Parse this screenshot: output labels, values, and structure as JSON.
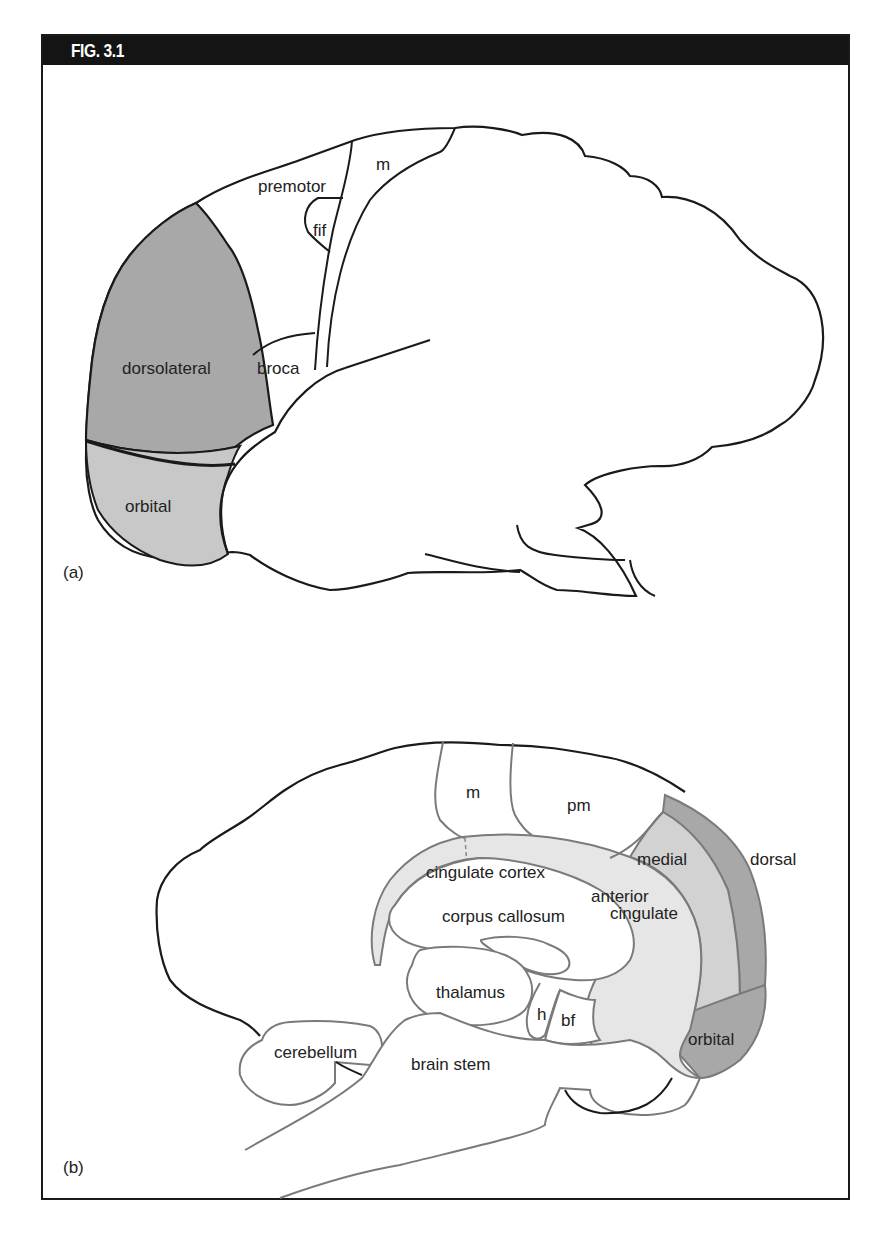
{
  "figure": {
    "title": "FIG. 3.1",
    "colors": {
      "header_bg": "#141414",
      "dark_gray": "#a8a8a8",
      "medium_gray": "#c8c8c8",
      "light_gray": "#e6e6e6",
      "outline": "#1a1a1a",
      "gray_outline": "#7a7a7a"
    }
  },
  "panel_a": {
    "panel_label": "(a)",
    "view": "lateral view of brain",
    "regions": {
      "premotor": "premotor",
      "motor": "m",
      "fif": "fif",
      "broca": "broca",
      "dorsolateral": "dorsolateral",
      "orbital": "orbital"
    }
  },
  "panel_b": {
    "panel_label": "(b)",
    "view": "medial view of brain",
    "regions": {
      "motor": "m",
      "premotor": "pm",
      "cingulate_cortex": "cingulate cortex",
      "corpus_callosum": "corpus callosum",
      "anterior_cingulate_1": "anterior",
      "anterior_cingulate_2": "cingulate",
      "medial": "medial",
      "dorsal": "dorsal",
      "orbital": "orbital",
      "thalamus": "thalamus",
      "hypothalamus": "h",
      "basal_forebrain": "bf",
      "cerebellum": "cerebellum",
      "brain_stem": "brain stem"
    }
  }
}
